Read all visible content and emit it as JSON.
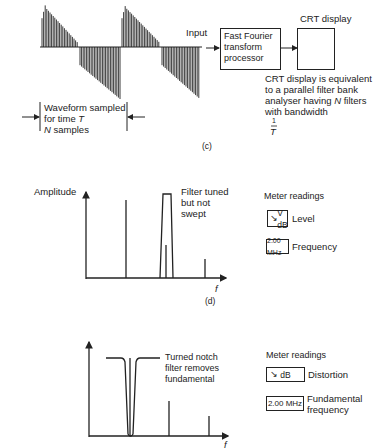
{
  "panel_c": {
    "caption": "(c)",
    "input_label": "Input",
    "fft_box": {
      "line1": "Fast Fourier",
      "line2": "transform",
      "line3": "processor"
    },
    "crt_label": "CRT display",
    "crt_note": {
      "line1": "CRT display is equivalent",
      "line2": "to a parallel filter bank",
      "line3a": "analyser having ",
      "line3n": "N",
      "line3b": " filters",
      "line4": "with bandwidth",
      "frac_num": "1",
      "frac_den": "T"
    },
    "sample_note": {
      "line1": "Waveform sampled",
      "line2a": "for time ",
      "line2t": "T",
      "line3n": "N",
      "line3b": " samples"
    }
  },
  "panel_d": {
    "caption": "(d)",
    "y_axis_label": "Amplitude",
    "x_axis_label": "f",
    "filter_note": {
      "line1": "Filter tuned",
      "line2": "but not",
      "line3": "swept"
    },
    "meter_title": "Meter readings",
    "meters": [
      {
        "icon": "needle-icon",
        "display": "V dB",
        "label": "Level"
      },
      {
        "icon": null,
        "display": "2.00 MHz",
        "label": "Frequency"
      }
    ]
  },
  "panel_e": {
    "x_axis_label": "f",
    "notch_note": {
      "line1": "Turned notch",
      "line2": "filter removes",
      "line3": "fundamental"
    },
    "meter_title": "Meter readings",
    "meters": [
      {
        "icon": "needle-icon",
        "display": "dB",
        "label": "Distortion"
      },
      {
        "icon": null,
        "display": "2.00 MHz",
        "label1": "Fundamental",
        "label2": "frequency"
      }
    ]
  },
  "chart_data": [
    {
      "type": "bar",
      "title": "(d) Spectrum with filter tuned but not swept",
      "xlabel": "f",
      "ylabel": "Amplitude",
      "categories": [
        "fundamental",
        "2nd harmonic",
        "3rd harmonic"
      ],
      "values": [
        78,
        34,
        19
      ],
      "annotations": [
        "Filter tuned but not swept"
      ]
    },
    {
      "type": "bar",
      "title": "(e) Spectrum with notch filter removing fundamental",
      "xlabel": "f",
      "ylabel": "",
      "categories": [
        "fundamental (notched)",
        "2nd harmonic",
        "3rd harmonic"
      ],
      "values": [
        78,
        35,
        20
      ],
      "annotations": [
        "Turned notch filter removes fundamental"
      ]
    }
  ]
}
